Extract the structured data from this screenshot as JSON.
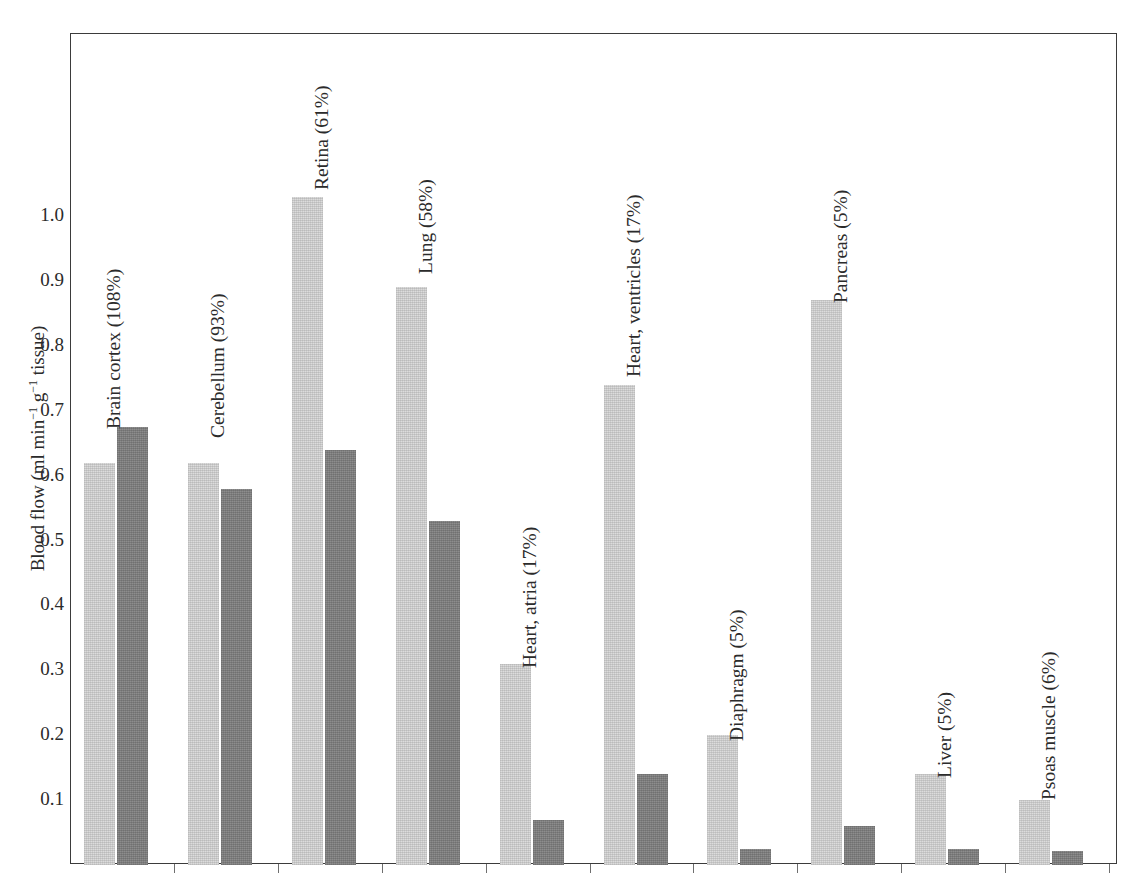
{
  "top_strip_text": "",
  "axis": {
    "y_title_prefix": "Blood flow (ml min",
    "y_title_exp1": "−1",
    "y_title_mid": " g",
    "y_title_exp2": "−1",
    "y_title_suffix": " tissue)",
    "y_title_plain": "Blood flow (ml min-1 g-1 tissue)",
    "y_ticks": [
      "1.0",
      "0.9",
      "0.8",
      "0.7",
      "0.6",
      "0.5",
      "0.4",
      "0.3",
      "0.2",
      "0.1"
    ]
  },
  "colors": {
    "series1": "#dcdcdc",
    "series2": "#8d8d8d",
    "frame": "#3b3b3b",
    "text": "#2b2b2b",
    "background": "#ffffff"
  },
  "labels": {
    "brain_cortex": "Brain cortex (108%)",
    "cerebellum": "Cerebellum (93%)",
    "retina": "Retina (61%)",
    "lung": "Lung (58%)",
    "heart_atria": "Heart, atria (17%)",
    "heart_ventricles": "Heart, ventricles (17%)",
    "diaphragm": "Diaphragm (5%)",
    "pancreas": "Pancreas (5%)",
    "liver": "Liver (5%)",
    "psoas_muscle": "Psoas muscle (6%)"
  },
  "chart_data": {
    "type": "bar",
    "title": "",
    "xlabel": "",
    "ylabel": "Blood flow (ml min-1 g-1 tissue)",
    "ylim": [
      0,
      1.12
    ],
    "ytick_values": [
      0.1,
      0.2,
      0.3,
      0.4,
      0.5,
      0.6,
      0.7,
      0.8,
      0.9,
      1.0
    ],
    "grid": false,
    "legend": "none",
    "categories": [
      "Brain cortex (108%)",
      "Cerebellum (93%)",
      "Retina (61%)",
      "Lung (58%)",
      "Heart, atria (17%)",
      "Heart, ventricles (17%)",
      "Diaphragm (5%)",
      "Pancreas (5%)",
      "Liver (5%)",
      "Psoas muscle (6%)"
    ],
    "series": [
      {
        "name": "series-1-light",
        "color": "#dcdcdc",
        "values": [
          0.62,
          0.62,
          1.03,
          0.89,
          0.31,
          0.74,
          0.2,
          0.87,
          0.14,
          0.1
        ]
      },
      {
        "name": "series-2-dark",
        "color": "#8d8d8d",
        "values": [
          0.675,
          0.58,
          0.64,
          0.53,
          0.07,
          0.14,
          0.025,
          0.06,
          0.025,
          0.022
        ]
      }
    ]
  }
}
